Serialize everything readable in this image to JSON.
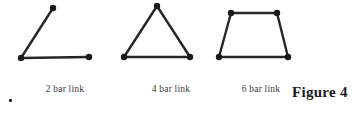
{
  "figure": {
    "label": "Figure 4",
    "stray_mark": "."
  },
  "captions": {
    "two_bar": "2 bar link",
    "four_bar": "4 bar link",
    "six_bar": "6 bar link"
  },
  "style": {
    "line_color": "#262626",
    "joint_color": "#1a1a1a",
    "background": "#ffffff",
    "line_width": 2.4,
    "joint_radius": 3.2
  },
  "chart_data": {
    "type": "diagram",
    "title": "Figure 4",
    "diagrams": [
      {
        "name": "2 bar link",
        "bars": 2,
        "joints": 3,
        "closed": false,
        "shape": "open V / obtuse angle",
        "points": [
          {
            "id": "A",
            "x": 21,
            "y": 58
          },
          {
            "id": "B",
            "x": 53,
            "y": 8
          },
          {
            "id": "C",
            "x": 89,
            "y": 57
          }
        ],
        "edges": [
          [
            "B",
            "A"
          ],
          [
            "A",
            "C"
          ]
        ]
      },
      {
        "name": "4 bar link",
        "bars": 4,
        "joints": 3,
        "closed": true,
        "shape": "triangle",
        "points": [
          {
            "id": "A",
            "x": 157,
            "y": 6
          },
          {
            "id": "B",
            "x": 124,
            "y": 57
          },
          {
            "id": "C",
            "x": 190,
            "y": 57
          }
        ],
        "edges": [
          [
            "A",
            "B"
          ],
          [
            "B",
            "C"
          ],
          [
            "C",
            "A"
          ]
        ]
      },
      {
        "name": "6 bar link",
        "bars": 6,
        "joints": 4,
        "closed": true,
        "shape": "trapezoid",
        "points": [
          {
            "id": "A",
            "x": 231,
            "y": 13
          },
          {
            "id": "B",
            "x": 277,
            "y": 13
          },
          {
            "id": "C",
            "x": 288,
            "y": 57
          },
          {
            "id": "D",
            "x": 219,
            "y": 57
          }
        ],
        "edges": [
          [
            "A",
            "B"
          ],
          [
            "B",
            "C"
          ],
          [
            "C",
            "D"
          ],
          [
            "D",
            "A"
          ]
        ]
      }
    ]
  }
}
